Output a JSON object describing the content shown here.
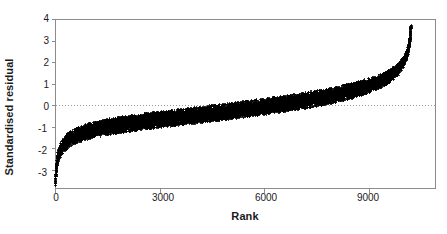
{
  "chart_data": {
    "type": "scatter",
    "title": "",
    "xlabel": "Rank",
    "ylabel": "Standardised residual",
    "xlim": [
      0,
      10900
    ],
    "ylim": [
      -3.85,
      4.0
    ],
    "xticks": [
      0,
      3000,
      6000,
      9000
    ],
    "xtick_labels": [
      "0",
      "3000",
      "6000",
      "9000"
    ],
    "yticks": [
      -3,
      -2,
      -1,
      0,
      1,
      2,
      3,
      4
    ],
    "ytick_labels": [
      "-3",
      "-2",
      "-1",
      "0",
      "1",
      "2",
      "3",
      "4"
    ],
    "grid": false,
    "legend": null,
    "reference_lines": [
      {
        "orientation": "horizontal",
        "value": 0,
        "style": "dotted",
        "color": "#999999"
      }
    ],
    "n_points": 10200,
    "marker": {
      "shape": "plus",
      "size": 1.6,
      "color": "#000000"
    },
    "series": [
      {
        "name": "Standardised residual",
        "color": "#000000",
        "quantile_profile": {
          "x_fraction": [
            0.0,
            0.002,
            0.005,
            0.01,
            0.02,
            0.035,
            0.055,
            0.08,
            0.11,
            0.15,
            0.2,
            0.25,
            0.3,
            0.35,
            0.4,
            0.45,
            0.5,
            0.55,
            0.6,
            0.65,
            0.7,
            0.75,
            0.8,
            0.85,
            0.89,
            0.92,
            0.945,
            0.965,
            0.98,
            0.99,
            0.995,
            0.998,
            1.0
          ],
          "center_y": [
            -3.7,
            -3.05,
            -2.55,
            -2.2,
            -1.9,
            -1.62,
            -1.42,
            -1.26,
            -1.12,
            -0.98,
            -0.85,
            -0.74,
            -0.64,
            -0.54,
            -0.44,
            -0.34,
            -0.24,
            -0.13,
            -0.02,
            0.1,
            0.23,
            0.37,
            0.54,
            0.76,
            0.98,
            1.18,
            1.42,
            1.7,
            2.05,
            2.45,
            2.85,
            3.25,
            3.7
          ],
          "half_width": [
            0.1,
            0.16,
            0.22,
            0.26,
            0.3,
            0.32,
            0.33,
            0.34,
            0.34,
            0.35,
            0.35,
            0.35,
            0.35,
            0.35,
            0.35,
            0.35,
            0.35,
            0.35,
            0.35,
            0.35,
            0.35,
            0.35,
            0.34,
            0.33,
            0.32,
            0.3,
            0.28,
            0.25,
            0.21,
            0.17,
            0.13,
            0.09,
            0.06
          ]
        }
      }
    ],
    "key_values": {
      "min_residual": -3.7,
      "max_residual": 3.7,
      "zero_crossing_rank": 5100,
      "max_rank": 10200
    }
  },
  "axes": {
    "y_title": "Standardised residual",
    "x_title": "Rank",
    "y_tick_texts": [
      "4",
      "3",
      "2",
      "1",
      "0",
      "-1",
      "-2",
      "-3"
    ],
    "x_tick_texts": [
      "0",
      "3000",
      "6000",
      "9000"
    ]
  },
  "style": {
    "point_color": "#000000",
    "axis_color": "#8c8c8c",
    "text_color": "#1a1a1a",
    "zero_line_color": "#a0a0a0",
    "background": "#ffffff"
  }
}
